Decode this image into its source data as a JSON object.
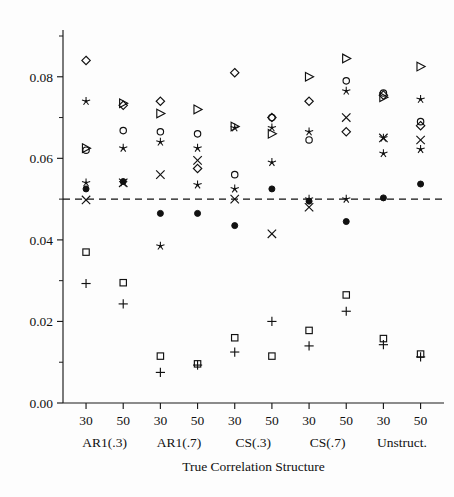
{
  "chart_data": {
    "type": "scatter",
    "title": "",
    "xlabel": "True Correlation Structure",
    "ylabel": "",
    "ylim": [
      0.0,
      0.09
    ],
    "yticks": [
      0.0,
      0.02,
      0.04,
      0.06,
      0.08
    ],
    "ytick_labels": [
      "0.00",
      "0.02",
      "0.04",
      "0.06",
      "0.08"
    ],
    "yminor_ticks": [
      0.01,
      0.03,
      0.05,
      0.07,
      0.09
    ],
    "grid": false,
    "legend": "none",
    "reference_line": {
      "y": 0.05,
      "style": "dashed",
      "label": ""
    },
    "x_categories": [
      "30",
      "50",
      "30",
      "50",
      "30",
      "50",
      "30",
      "50",
      "30",
      "50"
    ],
    "group_labels": [
      "AR1(.3)",
      "AR1(.7)",
      "CS(.3)",
      "CS(.7)",
      "Unstruct."
    ],
    "group_spans": [
      [
        0,
        1
      ],
      [
        2,
        3
      ],
      [
        4,
        5
      ],
      [
        6,
        7
      ],
      [
        8,
        9
      ]
    ],
    "marker_kinds": [
      "diamond",
      "star",
      "circle",
      "triangle",
      "cross",
      "dot",
      "square",
      "plus"
    ],
    "series": [
      {
        "name": "diamond",
        "marker": "diamond",
        "values": [
          0.084,
          0.073,
          0.074,
          0.0575,
          0.081,
          0.07,
          0.074,
          0.0665,
          0.0755,
          0.068
        ]
      },
      {
        "name": "star",
        "marker": "star",
        "values": [
          0.074,
          0.0625,
          0.064,
          0.0625,
          0.0675,
          0.0675,
          0.0665,
          0.0765,
          0.065,
          0.0745
        ]
      },
      {
        "name": "circle",
        "marker": "circle",
        "values": [
          0.062,
          0.0668,
          0.0665,
          0.066,
          0.056,
          0.07,
          0.0645,
          0.079,
          0.076,
          0.069
        ]
      },
      {
        "name": "triangle",
        "marker": "triangle",
        "values": [
          0.0625,
          0.0735,
          0.071,
          0.072,
          0.0678,
          0.066,
          0.08,
          0.0845,
          0.075,
          0.0825
        ]
      },
      {
        "name": "cross",
        "marker": "cross",
        "values": [
          0.0498,
          0.054,
          0.056,
          0.0595,
          0.05,
          0.0415,
          0.048,
          0.07,
          0.065,
          0.0645
        ]
      },
      {
        "name": "dot",
        "marker": "dot",
        "values": [
          0.0525,
          0.0543,
          0.0465,
          0.0465,
          0.0435,
          0.0525,
          0.0495,
          0.0445,
          0.0503,
          0.0537
        ]
      },
      {
        "name": "star2",
        "marker": "star",
        "values": [
          0.054,
          0.054,
          0.0385,
          0.0535,
          0.0525,
          0.059,
          0.05,
          0.05,
          0.0612,
          0.0622
        ]
      },
      {
        "name": "square",
        "marker": "square",
        "values": [
          0.037,
          0.0295,
          0.0115,
          0.0096,
          0.016,
          0.0115,
          0.0178,
          0.0265,
          0.0158,
          0.012
        ]
      },
      {
        "name": "plus",
        "marker": "plus",
        "values": [
          0.0293,
          0.0243,
          0.0075,
          0.0093,
          0.0125,
          0.02,
          0.014,
          0.0225,
          0.0143,
          0.0113
        ]
      }
    ]
  },
  "axis": {
    "x_title": "True Correlation Structure"
  }
}
